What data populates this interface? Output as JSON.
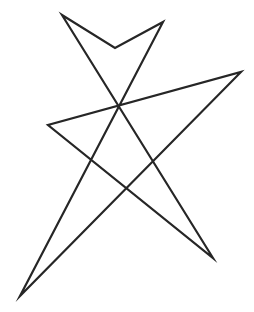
{
  "canvas": {
    "width": 254,
    "height": 312,
    "background_color": "#ffffff",
    "description": "Hand-drawn style closed star polygon outline"
  },
  "figure": {
    "name": "seven-vertex-star-polygon",
    "stroke_color": "#262626",
    "stroke_width": 2.2,
    "fill": "none",
    "closed": true,
    "vertex_count": 7,
    "vertices": [
      {
        "label": "top-left-peak",
        "x": 62,
        "y": 15
      },
      {
        "label": "top-notch",
        "x": 115,
        "y": 48
      },
      {
        "label": "top-right-peak",
        "x": 163,
        "y": 22
      },
      {
        "label": "bottom-left-tip",
        "x": 20,
        "y": 296
      },
      {
        "label": "right-tip",
        "x": 241,
        "y": 72
      },
      {
        "label": "left-tip",
        "x": 48,
        "y": 125
      },
      {
        "label": "bottom-right-tip",
        "x": 213,
        "y": 258
      }
    ],
    "path_d": "M 62 15 L 115 48 L 163 22 L 20 296 L 241 72 L 48 125 L 213 258 Z",
    "self_intersections": [
      {
        "label": "center-crossing",
        "x": 117,
        "y": 105
      },
      {
        "label": "upper-left-crossing",
        "x": 91,
        "y": 162
      },
      {
        "label": "lower-mid-crossing",
        "x": 128,
        "y": 191
      },
      {
        "label": "right-crossing",
        "x": 158,
        "y": 172
      }
    ]
  }
}
